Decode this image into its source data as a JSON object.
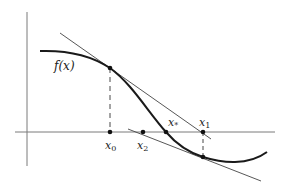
{
  "figure": {
    "function_label": "f(x)",
    "points": [
      {
        "id": "x0",
        "base": "x",
        "sub": "0"
      },
      {
        "id": "x2",
        "base": "x",
        "sub": "2"
      },
      {
        "id": "xstar",
        "base": "x",
        "sub": "*"
      },
      {
        "id": "x1",
        "base": "x",
        "sub": "1"
      }
    ],
    "colors": {
      "curve": "#1a1a1a",
      "axes": "#777777",
      "tangent": "#444444",
      "dashed": "#333333",
      "dot": "#111111"
    }
  }
}
